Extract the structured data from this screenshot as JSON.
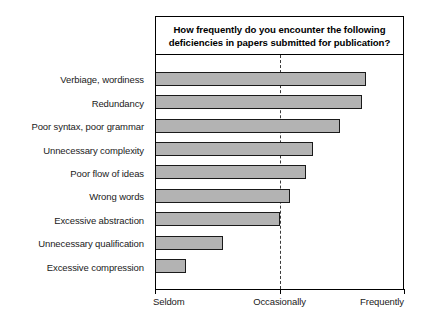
{
  "chart_data": {
    "type": "bar",
    "orientation": "horizontal",
    "title": "How frequently do you encounter the following deficiencies in papers submitted for publication?",
    "title_lines": [
      "How frequently do you encounter the following",
      "deficiencies in papers submitted for publication?"
    ],
    "categories": [
      "Verbiage, wordiness",
      "Redundancy",
      "Poor syntax, poor grammar",
      "Unnecessary complexity",
      "Poor flow of ideas",
      "Wrong words",
      "Excessive abstraction",
      "Unnecessary qualification",
      "Excessive compression"
    ],
    "values": [
      1.71,
      1.68,
      1.5,
      1.28,
      1.22,
      1.09,
      1.01,
      0.55,
      0.25
    ],
    "xlabel": "",
    "ylabel": "",
    "xlim": [
      0,
      2
    ],
    "xtick_values": [
      0,
      1,
      2
    ],
    "xtick_labels": [
      "Seldom",
      "Occasionally",
      "Frequently"
    ],
    "gridlines": {
      "vertical_dashed_at": [
        1
      ],
      "horizontal": false
    },
    "legend": null,
    "bar_fill_color": "#b3b3b3",
    "bar_border_color": "#1a1a1a",
    "frame_color": "#000000",
    "background_color": "#ffffff"
  }
}
